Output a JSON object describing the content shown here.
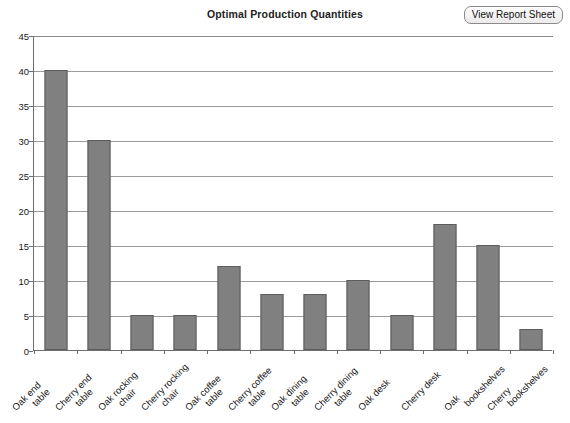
{
  "header": {
    "title": "Optimal Production Quantities",
    "view_report_label": "View Report Sheet"
  },
  "axes": {
    "y_ticks": [
      "45",
      "40",
      "35",
      "30",
      "25",
      "20",
      "15",
      "10",
      "5",
      "0"
    ]
  },
  "chart_data": {
    "type": "bar",
    "title": "Optimal Production Quantities",
    "xlabel": "",
    "ylabel": "",
    "ylim": [
      0,
      45
    ],
    "ytick_step": 5,
    "grid": true,
    "legend": false,
    "bar_color": "#808080",
    "bar_edge_color": "#5c5c5c",
    "categories": [
      "Oak end table",
      "Cherry end table",
      "Oak rocking chair",
      "Cherry rocking chair",
      "Oak coffee table",
      "Cherry coffee table",
      "Oak dining table",
      "Cherry dining table",
      "Oak desk",
      "Cherry desk",
      "Oak bookshelves",
      "Cherry bookshelves"
    ],
    "category_lines": [
      [
        "Oak end",
        "table"
      ],
      [
        "Cherry end",
        "table"
      ],
      [
        "Oak rocking",
        "chair"
      ],
      [
        "Cherry rocking",
        "chair"
      ],
      [
        "Oak coffee",
        "table"
      ],
      [
        "Cherry coffee",
        "table"
      ],
      [
        "Oak dining",
        "table"
      ],
      [
        "Cherry dining",
        "table"
      ],
      [
        "Oak desk",
        ""
      ],
      [
        "Cherry desk",
        ""
      ],
      [
        "Oak",
        "bookshelves"
      ],
      [
        "Cherry",
        "bookshelves"
      ]
    ],
    "values": [
      40,
      30,
      5,
      5,
      12,
      8,
      8,
      10,
      5,
      18,
      15,
      3
    ]
  }
}
